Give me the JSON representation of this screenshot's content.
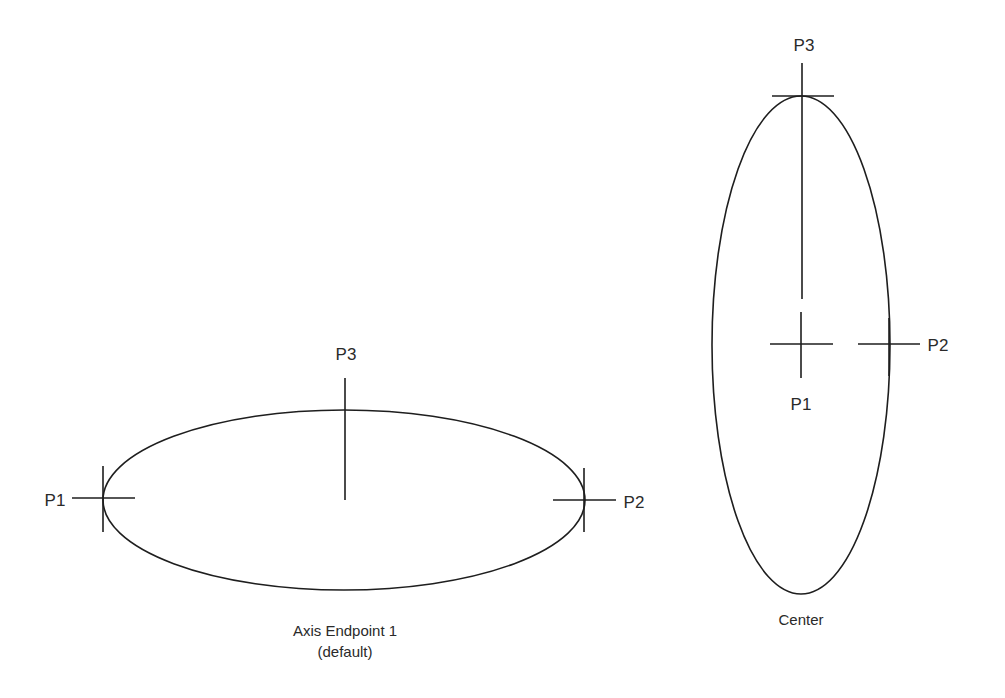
{
  "diagrams": [
    {
      "id": "axis-endpoint",
      "caption_line1": "Axis Endpoint 1",
      "caption_line2": "(default)",
      "points": {
        "p1": "P1",
        "p2": "P2",
        "p3": "P3"
      }
    },
    {
      "id": "center",
      "caption_line1": "Center",
      "points": {
        "p1": "P1",
        "p2": "P2",
        "p3": "P3"
      }
    }
  ],
  "colors": {
    "line": "#1e1e1e",
    "text": "#2a2a2a",
    "background": "#ffffff"
  }
}
